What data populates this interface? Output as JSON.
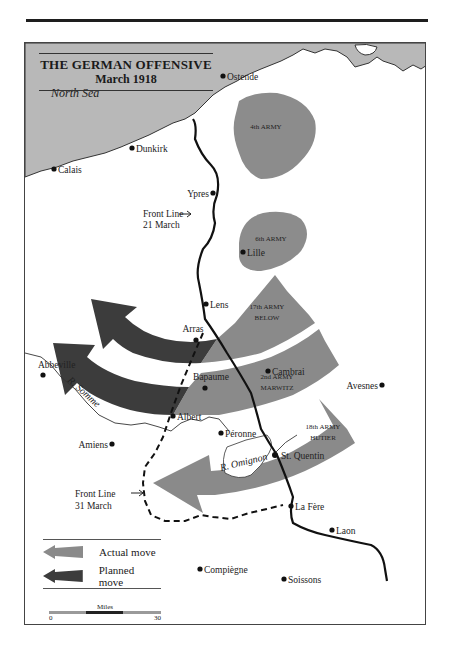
{
  "title": {
    "main": "THE GERMAN OFFENSIVE",
    "sub": "March 1918"
  },
  "sea": {
    "label": "North Sea"
  },
  "towns": [
    {
      "name": "Ostende",
      "x": 198,
      "y": 33,
      "label_side": "right"
    },
    {
      "name": "Dunkirk",
      "x": 107,
      "y": 105,
      "label_side": "right"
    },
    {
      "name": "Calais",
      "x": 29,
      "y": 126,
      "label_side": "right"
    },
    {
      "name": "Ypres",
      "x": 188,
      "y": 150,
      "label_side": "left"
    },
    {
      "name": "Lille",
      "x": 218,
      "y": 209,
      "label_side": "right"
    },
    {
      "name": "Lens",
      "x": 181,
      "y": 261,
      "label_side": "right"
    },
    {
      "name": "Arras",
      "x": 171,
      "y": 297,
      "label_side": "above"
    },
    {
      "name": "Abbeville",
      "x": 18,
      "y": 332,
      "label_side": "above"
    },
    {
      "name": "Cambrai",
      "x": 243,
      "y": 328,
      "label_side": "right"
    },
    {
      "name": "Bapaume",
      "x": 180,
      "y": 345,
      "label_side": "above"
    },
    {
      "name": "Avesnes",
      "x": 357,
      "y": 342,
      "label_side": "left"
    },
    {
      "name": "Albert",
      "x": 148,
      "y": 373,
      "label_side": "right"
    },
    {
      "name": "Péronne",
      "x": 196,
      "y": 390,
      "label_side": "right"
    },
    {
      "name": "Amiens",
      "x": 87,
      "y": 401,
      "label_side": "left"
    },
    {
      "name": "St. Quentin",
      "x": 250,
      "y": 412,
      "label_side": "right"
    },
    {
      "name": "La Fère",
      "x": 266,
      "y": 463,
      "label_side": "right"
    },
    {
      "name": "Laon",
      "x": 307,
      "y": 487,
      "label_side": "right"
    },
    {
      "name": "Compiègne",
      "x": 175,
      "y": 526,
      "label_side": "right"
    },
    {
      "name": "Soissons",
      "x": 259,
      "y": 536,
      "label_side": "right"
    }
  ],
  "armies": [
    {
      "label": "4th ARMY",
      "type": "static"
    },
    {
      "label": "6th ARMY",
      "type": "static"
    },
    {
      "label_line1": "17th ARMY",
      "label_line2": "BELOW",
      "type": "attack"
    },
    {
      "label_line1": "2nd ARMY",
      "label_line2": "MARWITZ",
      "type": "attack"
    },
    {
      "label_line1": "18th ARMY",
      "label_line2": "HUTIER",
      "type": "attack"
    }
  ],
  "rivers": [
    {
      "label": "R. Somme"
    },
    {
      "label": "R. Omignon"
    }
  ],
  "front_lines": [
    {
      "label_line1": "Front Line",
      "label_line2": "21 March",
      "style": "solid"
    },
    {
      "label_line1": "Front Line",
      "label_line2": "31 March",
      "style": "dashed"
    }
  ],
  "legend": {
    "items": [
      {
        "label": "Actual move",
        "color": "#8a8a8a"
      },
      {
        "label": "Planned move",
        "color": "#3c3c3c"
      }
    ]
  },
  "scale": {
    "title": "Miles",
    "min": "0",
    "max": "30"
  },
  "colors": {
    "sea": "#b8b8b8",
    "army_area": "#8c8c8c",
    "actual_move": "#8a8a8a",
    "planned_move": "#3c3c3c",
    "land": "#ffffff",
    "line": "#111111"
  }
}
